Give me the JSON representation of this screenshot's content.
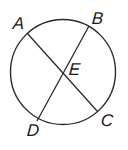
{
  "diagram": {
    "type": "circle-with-intersecting-chords",
    "stroke_color": "#2b2b2b",
    "circle": {
      "cx": 63,
      "cy": 72,
      "r": 52.5
    },
    "points": {
      "A": {
        "label": "A",
        "x": 27,
        "y": 33
      },
      "B": {
        "label": "B",
        "x": 89,
        "y": 26
      },
      "C": {
        "label": "C",
        "x": 98,
        "y": 112
      },
      "D": {
        "label": "D",
        "x": 37,
        "y": 121
      },
      "E": {
        "label": "E",
        "x": 62,
        "y": 74
      }
    },
    "chords": [
      {
        "name": "AC",
        "from": "A",
        "to": "C"
      },
      {
        "name": "BD",
        "from": "B",
        "to": "D"
      }
    ]
  }
}
